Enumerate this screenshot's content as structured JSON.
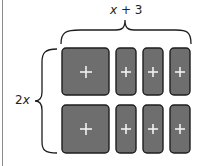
{
  "diagram": {
    "top_label": {
      "var": "x",
      "rest": " + 3"
    },
    "left_label": {
      "coef": "2",
      "var": "x"
    },
    "colors": {
      "tile_fill": "#6e6e6e",
      "tile_stroke": "#1e1e1e",
      "plus": "#f2f2f2",
      "brace": "#1e1e1e"
    },
    "rows": [
      {
        "tiles": [
          {
            "type": "x-squared",
            "sign": "+"
          },
          {
            "type": "x",
            "sign": "+"
          },
          {
            "type": "x",
            "sign": "+"
          },
          {
            "type": "x",
            "sign": "+"
          }
        ]
      },
      {
        "tiles": [
          {
            "type": "x-squared",
            "sign": "+"
          },
          {
            "type": "x",
            "sign": "+"
          },
          {
            "type": "x",
            "sign": "+"
          },
          {
            "type": "x",
            "sign": "+"
          }
        ]
      }
    ]
  }
}
